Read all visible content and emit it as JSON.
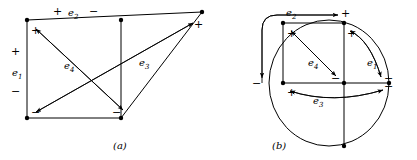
{
  "figure": {
    "title": "",
    "captions": [
      {
        "id": "caption-a",
        "text": "(a)",
        "x": 113,
        "y": 146
      },
      {
        "id": "caption-b",
        "text": "(b)",
        "x": 272,
        "y": 146
      }
    ]
  },
  "panel_a": {
    "label": "(a)",
    "edge_labels": [
      {
        "name": "e1",
        "base": "e",
        "sub": "1",
        "x": 14,
        "y": 73
      },
      {
        "name": "e2",
        "base": "e",
        "sub": "2",
        "x": 70,
        "y": 12
      },
      {
        "name": "e3",
        "base": "e",
        "sub": "3",
        "x": 141,
        "y": 63
      },
      {
        "name": "e4",
        "base": "e",
        "sub": "4",
        "x": 66,
        "y": 66
      }
    ],
    "polarity_marks": [
      {
        "name": "e2-plus",
        "text": "+",
        "x": 55,
        "y": 14
      },
      {
        "name": "e2-minus",
        "text": "−",
        "x": 91,
        "y": 14
      },
      {
        "name": "e1-plus",
        "text": "+",
        "x": 15,
        "y": 54
      },
      {
        "name": "e1-minus",
        "text": "−",
        "x": 15,
        "y": 90
      },
      {
        "name": "e4-plus",
        "text": "+",
        "x": 32,
        "y": 31
      },
      {
        "name": "e4-minus",
        "text": "−",
        "x": 113,
        "y": 113
      },
      {
        "name": "e3-plus",
        "text": "+",
        "x": 196,
        "y": 26
      },
      {
        "name": "e3-minus",
        "text": "−",
        "x": 32,
        "y": 113
      }
    ]
  },
  "panel_b": {
    "label": "(b)",
    "edge_labels": [
      {
        "name": "e1",
        "base": "e",
        "sub": "1",
        "x": 369,
        "y": 63
      },
      {
        "name": "e2",
        "base": "e",
        "sub": "2",
        "x": 288,
        "y": 12
      },
      {
        "name": "e3",
        "base": "e",
        "sub": "3",
        "x": 316,
        "y": 101
      },
      {
        "name": "e4",
        "base": "e",
        "sub": "4",
        "x": 310,
        "y": 63
      }
    ],
    "polarity_marks": [
      {
        "name": "e2-plus",
        "text": "+",
        "x": 344,
        "y": 13
      },
      {
        "name": "e2-minus",
        "text": "−",
        "x": 255,
        "y": 83
      },
      {
        "name": "e4-plus",
        "text": "+",
        "x": 288,
        "y": 34
      },
      {
        "name": "e4-minus",
        "text": "−",
        "x": 333,
        "y": 80
      },
      {
        "name": "e1-plus",
        "text": "+",
        "x": 342,
        "y": 34
      },
      {
        "name": "e1-minus",
        "text": "−",
        "x": 387,
        "y": 80
      },
      {
        "name": "e3-plus",
        "text": "+",
        "x": 288,
        "y": 93
      },
      {
        "name": "e3-minus",
        "text": "−",
        "x": 387,
        "y": 87
      }
    ]
  },
  "graph_data": {
    "type": "diagram",
    "description": "Electrical network graph and its dual, with four branches e1..e4 each marked by a polarity (+/-) arrow.",
    "edges": [
      "e1",
      "e2",
      "e3",
      "e4"
    ],
    "panels": [
      "(a)",
      "(b)"
    ]
  }
}
